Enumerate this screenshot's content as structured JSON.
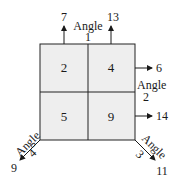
{
  "diagram": {
    "type": "quadrant-grid-with-angles",
    "grid": {
      "fill": "#eeeeee",
      "stroke": "#222222",
      "cells": [
        {
          "position": "top-left",
          "value": "2"
        },
        {
          "position": "top-right",
          "value": "4"
        },
        {
          "position": "bottom-left",
          "value": "5"
        },
        {
          "position": "bottom-right",
          "value": "9"
        }
      ]
    },
    "angles": [
      {
        "label": "Angle",
        "number": "1",
        "side": "top",
        "arrows": [
          "7",
          "13"
        ]
      },
      {
        "label": "Angle",
        "number": "2",
        "side": "right",
        "arrows": [
          "6",
          "14"
        ]
      },
      {
        "label": "Angle",
        "number": "3",
        "side": "bottom-right",
        "arrows": [
          "11"
        ]
      },
      {
        "label": "Angle",
        "number": "4",
        "side": "bottom-left",
        "arrows": [
          "9"
        ]
      }
    ]
  }
}
